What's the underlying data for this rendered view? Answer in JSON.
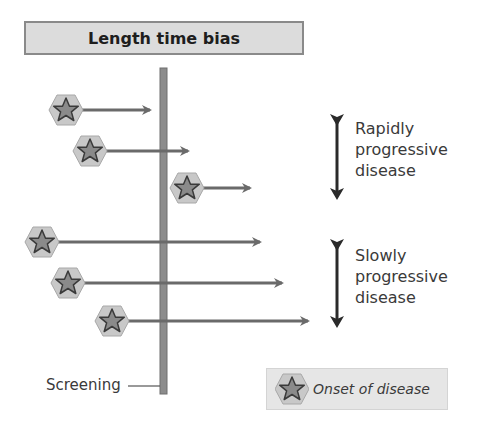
{
  "title": "Length time bias",
  "screening_label": "Screening",
  "groups": [
    {
      "label_lines": [
        "Rapidly",
        "progressive",
        "disease"
      ]
    },
    {
      "label_lines": [
        "Slowly",
        "progressive",
        "disease"
      ]
    }
  ],
  "legend": {
    "icon": "star-hexagon-icon",
    "label": "Onset of disease"
  },
  "onsets": [
    {
      "group": "rapid",
      "icon_x": 66,
      "y": 110,
      "arrow_end": 150
    },
    {
      "group": "rapid",
      "icon_x": 90,
      "y": 151,
      "arrow_end": 188
    },
    {
      "group": "rapid",
      "icon_x": 187,
      "y": 188,
      "arrow_end": 250
    },
    {
      "group": "slow",
      "icon_x": 42,
      "y": 242,
      "arrow_end": 260
    },
    {
      "group": "slow",
      "icon_x": 68,
      "y": 283,
      "arrow_end": 282
    },
    {
      "group": "slow",
      "icon_x": 112,
      "y": 321,
      "arrow_end": 308
    }
  ],
  "colors": {
    "title_bg": "#dcdcdc",
    "screening_line": "#8c8c8c",
    "arrow": "#6a6a6a",
    "hexagon": "#c8c8c8",
    "star": "#8a8a8a",
    "bracket_arrow": "#2a2a2a"
  }
}
